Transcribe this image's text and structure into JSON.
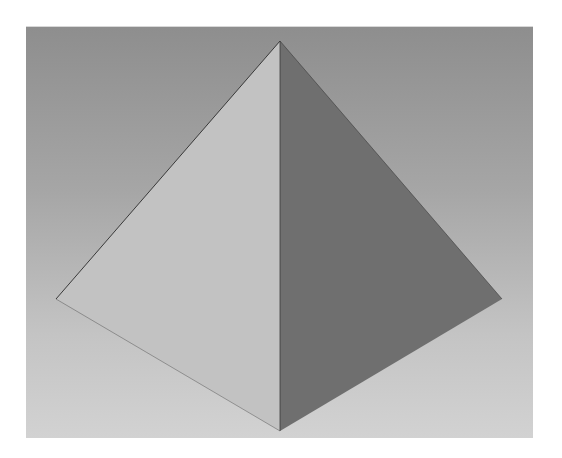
{
  "scene": {
    "subject": "3D pyramid render",
    "background_gradient": [
      "#8e8e8e",
      "#d2d2d2"
    ],
    "faces": [
      {
        "name": "left-face",
        "color": "#c2c2c2",
        "points": "254,14 30,272 254,404"
      },
      {
        "name": "right-face",
        "color": "#6f6f6f",
        "points": "254,14 476,272 254,404"
      }
    ],
    "edge_color": "#3a3a3a"
  }
}
